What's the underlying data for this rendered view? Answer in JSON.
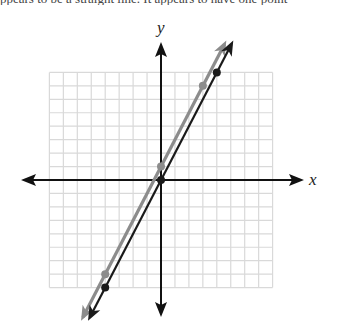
{
  "header": {
    "cutoff_text": "ppears to be a straight line. It appears to have one point"
  },
  "chart_data": {
    "type": "line",
    "title": "",
    "xlabel": "x",
    "ylabel": "y",
    "xlim": [
      -8,
      8
    ],
    "ylim": [
      -8,
      8
    ],
    "grid": true,
    "grid_step": 1,
    "legend": null,
    "series": [
      {
        "name": "gray line",
        "equation": "y = 2x + 1",
        "color": "#8c8c8c",
        "points": [
          [
            -4,
            -7
          ],
          [
            0,
            1
          ],
          [
            3,
            7
          ]
        ],
        "arrows": "both"
      },
      {
        "name": "black line",
        "equation": "y = 2x",
        "color": "#1a1a1a",
        "points": [
          [
            -4,
            -8
          ],
          [
            0,
            0
          ],
          [
            4,
            8
          ]
        ],
        "arrows": "both"
      }
    ]
  },
  "colors": {
    "grid": "#d9d9d9",
    "axis": "#111111",
    "gray_line": "#8c8c8c",
    "black_line": "#1a1a1a"
  }
}
